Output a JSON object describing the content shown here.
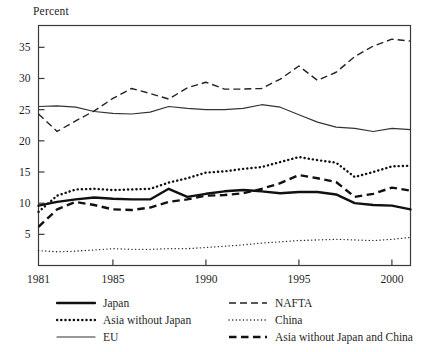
{
  "chart_data": {
    "type": "line",
    "title": "",
    "subtitle": "",
    "xlabel": "",
    "ylabel": "Percent",
    "xlim": [
      1981,
      2001
    ],
    "ylim": [
      0,
      38.5
    ],
    "yticks": [
      5,
      10,
      15,
      20,
      25,
      30,
      35
    ],
    "xticks": [
      1981,
      1985,
      1990,
      1995,
      2000
    ],
    "ytick_labels": [
      "5",
      "10",
      "15",
      "20",
      "25",
      "30",
      "35"
    ],
    "xtick_labels": [
      "1981",
      "1985",
      "1990",
      "1995",
      "2000"
    ],
    "grid": false,
    "legend_position": "below",
    "x": [
      1981,
      1982,
      1983,
      1984,
      1985,
      1986,
      1987,
      1988,
      1989,
      1990,
      1991,
      1992,
      1993,
      1994,
      1995,
      1996,
      1997,
      1998,
      1999,
      2000,
      2001
    ],
    "series": [
      {
        "name": "Japan",
        "style": "solid-thick",
        "color": "#111111",
        "values": [
          9.6,
          10.2,
          10.6,
          10.9,
          10.7,
          10.6,
          10.6,
          12.3,
          11.0,
          11.5,
          11.9,
          12.1,
          11.9,
          11.6,
          11.8,
          11.8,
          11.4,
          10.0,
          9.7,
          9.6,
          9.0
        ]
      },
      {
        "name": "Asia without Japan",
        "style": "dotted-thick",
        "color": "#111111",
        "values": [
          8.6,
          11.2,
          12.2,
          12.3,
          12.1,
          12.2,
          12.3,
          13.3,
          14.0,
          14.9,
          15.1,
          15.5,
          15.8,
          16.6,
          17.4,
          16.9,
          16.5,
          14.2,
          15.0,
          15.9,
          16.0
        ]
      },
      {
        "name": "EU",
        "style": "solid-thin",
        "color": "#333333",
        "values": [
          25.5,
          25.6,
          25.4,
          24.7,
          24.4,
          24.3,
          24.6,
          25.5,
          25.2,
          25.0,
          25.0,
          25.2,
          25.8,
          25.4,
          24.2,
          23.0,
          22.2,
          22.0,
          21.5,
          22.0,
          21.8
        ]
      },
      {
        "name": "NAFTA",
        "style": "dashed-long",
        "color": "#222222",
        "values": [
          24.3,
          21.5,
          23.2,
          24.8,
          26.8,
          28.4,
          27.6,
          26.7,
          28.5,
          29.4,
          28.3,
          28.3,
          28.4,
          29.9,
          32.0,
          29.7,
          31.0,
          33.5,
          35.2,
          36.3,
          36.0
        ]
      },
      {
        "name": "China",
        "style": "dotted-fine",
        "color": "#222222",
        "values": [
          2.4,
          2.2,
          2.3,
          2.5,
          2.7,
          2.6,
          2.6,
          2.7,
          2.7,
          2.9,
          3.1,
          3.3,
          3.6,
          3.8,
          4.0,
          4.1,
          4.2,
          4.1,
          4.0,
          4.2,
          4.5
        ]
      },
      {
        "name": "Asia without Japan and China",
        "style": "dashed-thick",
        "color": "#111111",
        "values": [
          6.2,
          9.0,
          10.2,
          9.7,
          9.0,
          8.9,
          9.3,
          10.2,
          10.6,
          11.2,
          11.3,
          11.6,
          12.3,
          13.2,
          14.5,
          14.0,
          13.4,
          11.0,
          11.5,
          12.5,
          12.0
        ]
      }
    ],
    "legend": [
      {
        "name": "Japan",
        "style": "solid-thick",
        "column": "left"
      },
      {
        "name": "Asia without Japan",
        "style": "dotted-thick",
        "column": "left"
      },
      {
        "name": "EU",
        "style": "solid-thin",
        "column": "left"
      },
      {
        "name": "NAFTA",
        "style": "dashed-long",
        "column": "right"
      },
      {
        "name": "China",
        "style": "dotted-fine",
        "column": "right"
      },
      {
        "name": "Asia without Japan and China",
        "style": "dashed-thick",
        "column": "right"
      }
    ]
  }
}
